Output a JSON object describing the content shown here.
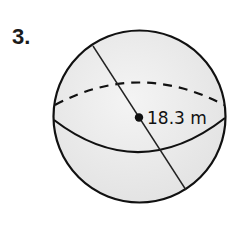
{
  "problem": {
    "number_label": "3."
  },
  "figure": {
    "shape": "sphere",
    "measure_label": "18.3 m",
    "measure_type": "diameter",
    "colors": {
      "fill": "#ebebeb",
      "stroke": "#111111"
    }
  }
}
